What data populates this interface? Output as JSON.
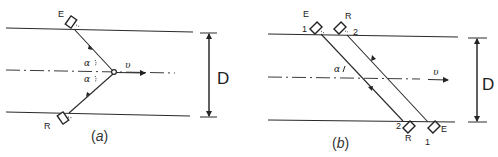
{
  "figure": {
    "panel_a": {
      "caption": "(a)",
      "caption_letter": "a",
      "emitter_label": "E",
      "receiver_label": "R",
      "angle_label_upper": "α",
      "angle_label_lower": "α",
      "velocity_label": "υ",
      "diameter_label": "D"
    },
    "panel_b": {
      "caption": "(b)",
      "caption_letter": "b",
      "top_emitter_label": "E",
      "top_emitter_index": "1",
      "top_receiver_label": "R",
      "top_receiver_index": "2",
      "bottom_receiver_label": "R",
      "bottom_receiver_index": "2",
      "bottom_emitter_label": "E",
      "bottom_emitter_index": "1",
      "angle_label": "α",
      "velocity_label": "υ",
      "diameter_label": "D"
    }
  },
  "colors": {
    "line": "#2a2a2a",
    "background": "#ffffff"
  }
}
